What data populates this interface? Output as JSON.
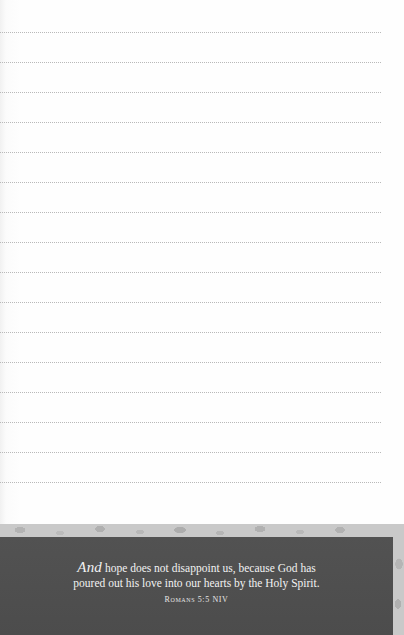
{
  "journal_page": {
    "ruled_lines": {
      "count": 16,
      "first_y": 32,
      "spacing": 30,
      "color": "#b9b9b9"
    },
    "banner": {
      "verse_lead": "And",
      "verse_line_1_rest": " hope does not disappoint us, because God has",
      "verse_line_2": "poured out his love into our hearts by the Holy Spirit.",
      "citation": "Romans 5:5 NIV",
      "box_color": "#4f4f4f",
      "pattern_color": "#c9c9c9",
      "text_color": "#f2f2f2"
    }
  }
}
